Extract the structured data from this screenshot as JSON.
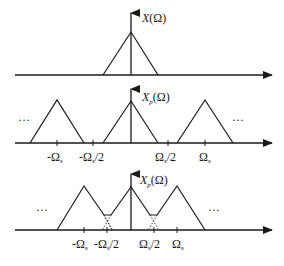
{
  "diagram": {
    "panels": [
      {
        "id": "original",
        "label": "X(Ω)",
        "label_main": "X",
        "label_sub": "",
        "label_arg": "(Ω)"
      },
      {
        "id": "sampled-no-aliasing",
        "label": "Xp(Ω)",
        "label_main": "X",
        "label_sub": "p",
        "label_arg": "(Ω)",
        "ticks": [
          "-Ωs",
          "-Ωs/2",
          "Ωs/2",
          "Ωs"
        ],
        "ellipsis_left": "···",
        "ellipsis_right": "···"
      },
      {
        "id": "sampled-aliasing",
        "label": "Xp(Ω)",
        "label_main": "X",
        "label_sub": "p",
        "label_arg": "(Ω)",
        "ticks": [
          "-Ωs",
          "-Ωs/2",
          "Ωs/2",
          "Ωs"
        ],
        "ellipsis_left": "···",
        "ellipsis_right": "···"
      }
    ],
    "tick_parts": {
      "neg_omega": "-Ω",
      "omega": "Ω",
      "s": "s",
      "half": "/2"
    }
  }
}
